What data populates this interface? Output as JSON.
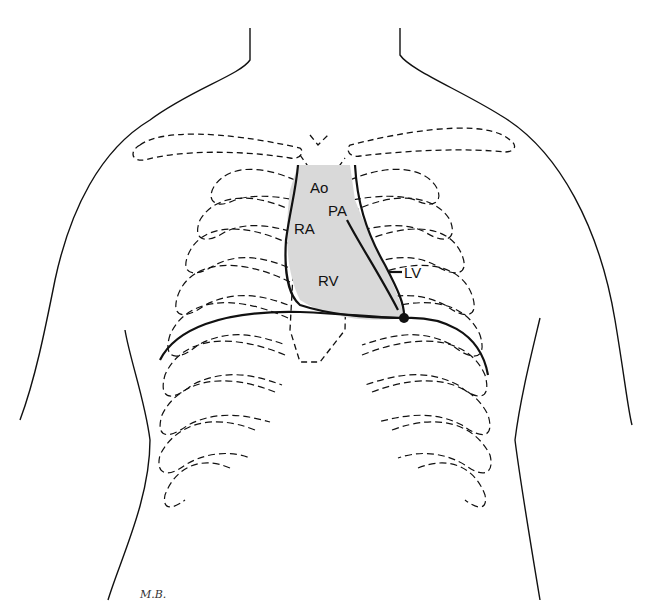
{
  "diagram": {
    "type": "anatomical-chest-heart-outline",
    "labels": {
      "aorta": "Ao",
      "pulmonary_artery": "PA",
      "right_atrium": "RA",
      "right_ventricle": "RV",
      "left_ventricle": "LV"
    },
    "signature": "M.B.",
    "colors": {
      "line": "#111111",
      "heart_fill": "#d9d9d9",
      "background": "#ffffff"
    }
  }
}
